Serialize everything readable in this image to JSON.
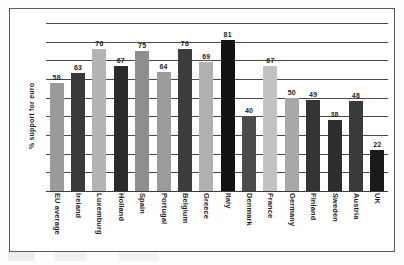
{
  "chart_data": {
    "type": "bar",
    "title": "",
    "subtitle": "",
    "xlabel": "",
    "ylabel": "% support for euro",
    "ylim": [
      0,
      90
    ],
    "grid": true,
    "gridline_values": [
      0,
      10,
      20,
      30,
      40,
      50,
      60,
      70,
      80,
      90
    ],
    "legend": "none",
    "categories": [
      "EU average",
      "Ireland",
      "Luxemburg",
      "Holland",
      "Spain",
      "Portugal",
      "Belgium",
      "Greece",
      "Italy",
      "Denmark",
      "France",
      "Germany",
      "Finland",
      "Sweden",
      "Austria",
      "UK"
    ],
    "values": [
      58,
      63,
      76,
      67,
      75,
      64,
      76,
      69,
      81,
      40,
      67,
      50,
      49,
      38,
      48,
      22
    ],
    "bar_colors": [
      "#9a9a9a",
      "#3a3a3a",
      "#b4b4b4",
      "#2b2b2b",
      "#8e8e8e",
      "#9c9c9c",
      "#3c3c3c",
      "#b0b0b0",
      "#111111",
      "#4a4a4a",
      "#c2c2c2",
      "#a8a8a8",
      "#333333",
      "#2e2e2e",
      "#3a3a3a",
      "#1a1a1a"
    ],
    "data_labels": [
      "58",
      "63",
      "76",
      "67",
      "75",
      "64",
      "76",
      "69",
      "81",
      "40",
      "67",
      "50",
      "49",
      "38",
      "48",
      "22"
    ]
  },
  "colors": {
    "frame_border": "#5a5a5a",
    "gridline": "#4a4a4a",
    "text": "#1d1d1d",
    "page_background": "#fdfdfc",
    "plot_background": "#ffffff"
  }
}
